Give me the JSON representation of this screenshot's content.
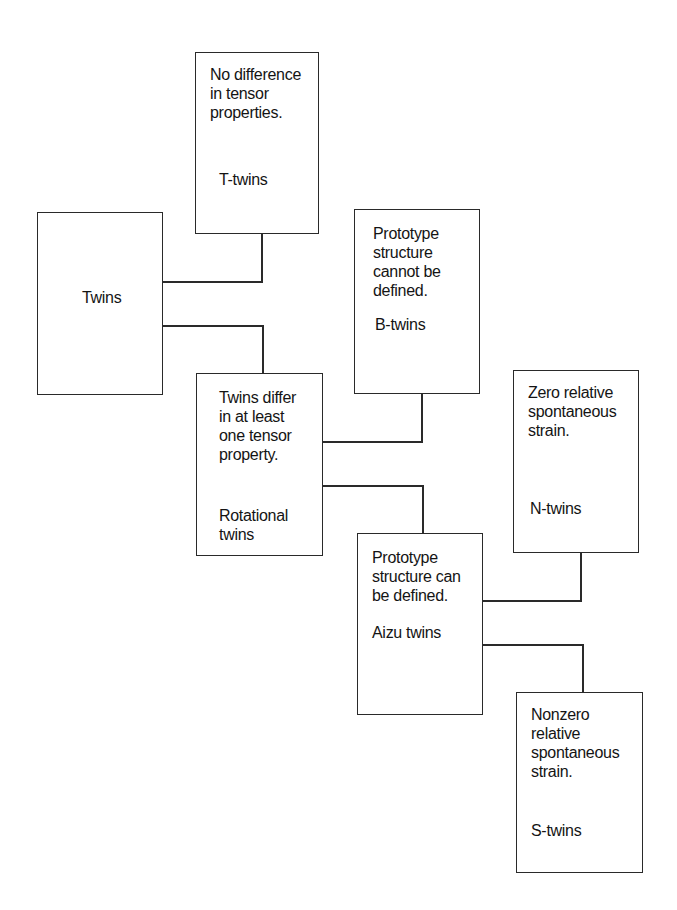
{
  "diagram": {
    "title": "",
    "nodes": {
      "root": {
        "name": "Twins"
      },
      "t_twins": {
        "description": "No difference\nin tensor\nproperties.",
        "name": "T-twins"
      },
      "rotational": {
        "description": "Twins differ\nin at least\none tensor\nproperty.",
        "name": "Rotational\ntwins"
      },
      "b_twins": {
        "description": "Prototype\nstructure\ncannot be\ndefined.",
        "name": "B-twins"
      },
      "aizu": {
        "description": "Prototype\nstructure can\nbe defined.",
        "name": "Aizu twins"
      },
      "n_twins": {
        "description": "Zero relative\nspontaneous\nstrain.",
        "name": "N-twins"
      },
      "s_twins": {
        "description": "Nonzero\nrelative\nspontaneous\nstrain.",
        "name": "S-twins"
      }
    },
    "edges": [
      {
        "from": "root",
        "to": "t_twins"
      },
      {
        "from": "root",
        "to": "rotational"
      },
      {
        "from": "rotational",
        "to": "b_twins"
      },
      {
        "from": "rotational",
        "to": "aizu"
      },
      {
        "from": "aizu",
        "to": "n_twins"
      },
      {
        "from": "aizu",
        "to": "s_twins"
      }
    ]
  }
}
